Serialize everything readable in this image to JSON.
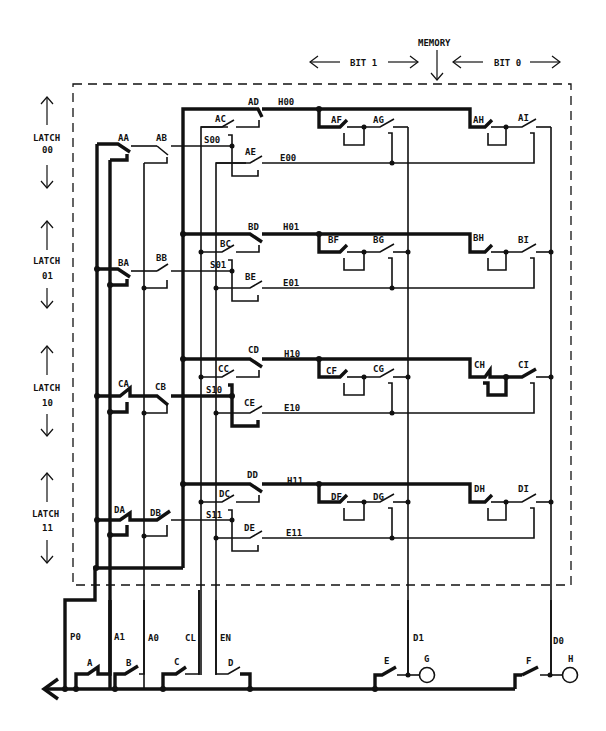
{
  "header": {
    "memory_label": "MEMORY",
    "bit1_label": "BIT 1",
    "bit0_label": "BIT 0"
  },
  "latches": [
    {
      "label": "LATCH",
      "address": "00"
    },
    {
      "label": "LATCH",
      "address": "01"
    },
    {
      "label": "LATCH",
      "address": "10"
    },
    {
      "label": "LATCH",
      "address": "11"
    }
  ],
  "rows": [
    {
      "a": "AA",
      "b": "AB",
      "c": "AC",
      "d": "AD",
      "e": "AE",
      "f": "AF",
      "g": "AG",
      "h": "AH",
      "i": "AI",
      "select": "S00",
      "hold": "H00",
      "enable": "E00"
    },
    {
      "a": "BA",
      "b": "BB",
      "c": "BC",
      "d": "BD",
      "e": "BE",
      "f": "BF",
      "g": "BG",
      "h": "BH",
      "i": "BI",
      "select": "S01",
      "hold": "H01",
      "enable": "E01"
    },
    {
      "a": "CA",
      "b": "CB",
      "c": "CC",
      "d": "CD",
      "e": "CE",
      "f": "CF",
      "g": "CG",
      "h": "CH",
      "i": "CI",
      "select": "S10",
      "hold": "H10",
      "enable": "E10"
    },
    {
      "a": "DA",
      "b": "DB",
      "c": "DC",
      "d": "DD",
      "e": "DE",
      "f": "DF",
      "g": "DG",
      "h": "DH",
      "i": "DI",
      "select": "S11",
      "hold": "H11",
      "enable": "E11"
    }
  ],
  "signals": {
    "p0": "P0",
    "a1": "A1",
    "a0": "A0",
    "cl": "CL",
    "en": "EN",
    "d1": "D1",
    "d0": "D0"
  },
  "input_switches": [
    "A",
    "B",
    "C",
    "D",
    "E",
    "F"
  ],
  "outputs": [
    "G",
    "H"
  ]
}
